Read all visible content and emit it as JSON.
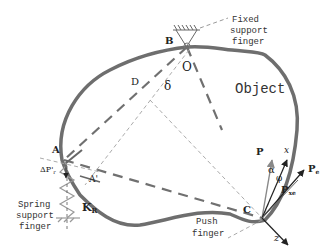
{
  "labels": {
    "fixed_support_1": "Fixed",
    "fixed_support_2": "support",
    "fixed_support_3": "finger",
    "object": "Object",
    "spring_support_1": "Spring",
    "spring_support_2": "support",
    "spring_support_3": "finger",
    "push_1": "Push",
    "push_2": "finger",
    "point_B": "B",
    "point_O": "O",
    "point_D": "D",
    "delta": "δ",
    "point_A": "A",
    "point_A_prime": "A'",
    "delta_P": "ΔP'",
    "delta_P_sub": "r",
    "K": "K",
    "K_sub": "R",
    "point_C": "C",
    "P": "P",
    "alpha": "α",
    "phi": "φ",
    "x": "x",
    "z": "z",
    "Pe": "P",
    "Pe_sub": "e",
    "Pxe": "P",
    "Pxe_sub": "xe"
  },
  "colors": {
    "outline": "#6e6e6e",
    "dashed": "#707070",
    "thin_dashed": "#a0a0a0",
    "arrow": "#222222"
  }
}
